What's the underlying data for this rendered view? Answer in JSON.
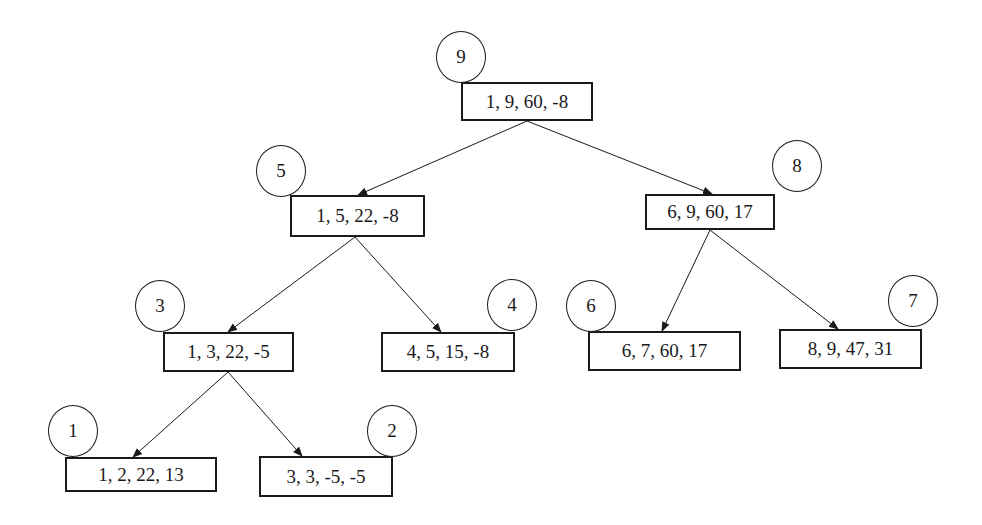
{
  "diagram": {
    "type": "binary-tree",
    "colors": {
      "stroke": "#1a1a1a",
      "background": "#ffffff"
    },
    "nodes": [
      {
        "id": "n9",
        "label": "9",
        "values": "1, 9, 60, -8",
        "box": [
          461,
          82,
          132,
          39
        ],
        "circle": [
          461,
          56
        ]
      },
      {
        "id": "n5",
        "label": "5",
        "values": "1, 5, 22, -8",
        "box": [
          290,
          195,
          135,
          42
        ],
        "circle": [
          281,
          170
        ]
      },
      {
        "id": "n8",
        "label": "8",
        "values": "6, 9, 60, 17",
        "box": [
          645,
          194,
          130,
          36
        ],
        "circle": [
          797,
          165
        ]
      },
      {
        "id": "n3",
        "label": "3",
        "values": "1, 3, 22, -5",
        "box": [
          163,
          332,
          131,
          40
        ],
        "circle": [
          160,
          305
        ]
      },
      {
        "id": "n4",
        "label": "4",
        "values": "4, 5, 15, -8",
        "box": [
          381,
          332,
          134,
          40
        ],
        "circle": [
          512,
          304
        ]
      },
      {
        "id": "n6",
        "label": "6",
        "values": "6, 7, 60, 17",
        "box": [
          588,
          331,
          153,
          40
        ],
        "circle": [
          591,
          305
        ]
      },
      {
        "id": "n7",
        "label": "7",
        "values": "8, 9, 47, 31",
        "box": [
          779,
          329,
          143,
          40
        ],
        "circle": [
          913,
          300
        ]
      },
      {
        "id": "n1",
        "label": "1",
        "values": "1, 2, 22, 13",
        "box": [
          65,
          457,
          152,
          35
        ],
        "circle": [
          73,
          430
        ]
      },
      {
        "id": "n2",
        "label": "2",
        "values": "3, 3, -5, -5",
        "box": [
          259,
          456,
          134,
          41
        ],
        "circle": [
          392,
          430
        ]
      }
    ],
    "edges": [
      {
        "from": "n9",
        "to": "n5",
        "x1": 527,
        "y1": 121,
        "x2": 358,
        "y2": 195
      },
      {
        "from": "n9",
        "to": "n8",
        "x1": 527,
        "y1": 121,
        "x2": 712,
        "y2": 194
      },
      {
        "from": "n5",
        "to": "n3",
        "x1": 355,
        "y1": 237,
        "x2": 228,
        "y2": 332
      },
      {
        "from": "n5",
        "to": "n4",
        "x1": 355,
        "y1": 237,
        "x2": 441,
        "y2": 332
      },
      {
        "from": "n8",
        "to": "n6",
        "x1": 710,
        "y1": 230,
        "x2": 662,
        "y2": 331
      },
      {
        "from": "n8",
        "to": "n7",
        "x1": 710,
        "y1": 230,
        "x2": 838,
        "y2": 329
      },
      {
        "from": "n3",
        "to": "n1",
        "x1": 228,
        "y1": 372,
        "x2": 133,
        "y2": 457
      },
      {
        "from": "n3",
        "to": "n2",
        "x1": 228,
        "y1": 372,
        "x2": 302,
        "y2": 456
      }
    ]
  }
}
